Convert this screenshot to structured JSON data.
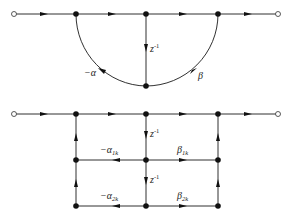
{
  "diagrams": [
    {
      "name": "direct-form-second-order-section",
      "labels": {
        "delay": "z",
        "delay_exp": "-1",
        "feedback": "−α",
        "feedforward": "β"
      }
    },
    {
      "name": "two-delay-section",
      "labels": {
        "delay1": "z",
        "delay1_exp": "-1",
        "delay2": "z",
        "delay2_exp": "-1",
        "alpha1": "−α",
        "alpha1_sub": "1k",
        "alpha2": "−α",
        "alpha2_sub": "2k",
        "beta1": "β",
        "beta1_sub": "1k",
        "beta2": "β",
        "beta2_sub": "2k"
      }
    }
  ]
}
